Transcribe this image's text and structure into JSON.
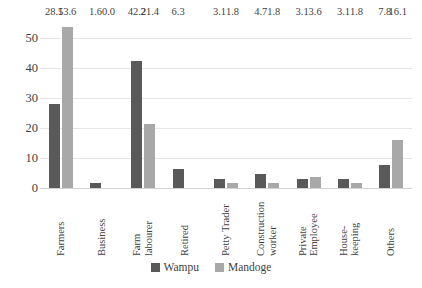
{
  "chart_data": {
    "type": "bar",
    "title": "",
    "subtitle": "",
    "xlabel": "",
    "ylabel": "",
    "ylim": [
      0,
      55
    ],
    "yticks": [
      0,
      10,
      20,
      30,
      40,
      50
    ],
    "grid": true,
    "legend_position": "bottom",
    "categories": [
      "Farmers",
      "Business",
      "Farm labourer",
      "Retired",
      "Petty Trader",
      "Construction worker",
      "Private Employee",
      "House-keeping",
      "Others"
    ],
    "category_lines": [
      [
        "Farmers"
      ],
      [
        "Business"
      ],
      [
        "Farm",
        "labourer"
      ],
      [
        "Retired"
      ],
      [
        "Petty Trader"
      ],
      [
        "Construction",
        "worker"
      ],
      [
        "Private",
        "Employee"
      ],
      [
        "House-",
        "keeping"
      ],
      [
        "Others"
      ]
    ],
    "series": [
      {
        "name": "Wampu",
        "color": "#595959",
        "values": [
          28.1,
          1.6,
          42.2,
          6.3,
          3.1,
          4.7,
          3.1,
          3.1,
          7.8
        ],
        "labels": [
          "28.1",
          "1.6",
          "42.2",
          "6.3",
          "3.1",
          "4.7",
          "3.1",
          "3.1",
          "7.8"
        ]
      },
      {
        "name": "Mandoge",
        "color": "#a8a8a8",
        "values": [
          53.6,
          0.0,
          21.4,
          null,
          1.8,
          1.8,
          3.6,
          1.8,
          16.1
        ],
        "labels": [
          "53.6",
          "0.0",
          "21.4",
          "",
          "1.8",
          "1.8",
          "3.6",
          "1.8",
          "16.1"
        ]
      }
    ]
  },
  "legend": {
    "items": [
      {
        "label": "Wampu",
        "color": "#595959"
      },
      {
        "label": "Mandoge",
        "color": "#a8a8a8"
      }
    ]
  },
  "axis": {
    "y_tick_labels": [
      "50",
      "40",
      "30",
      "20",
      "10",
      "0"
    ]
  }
}
